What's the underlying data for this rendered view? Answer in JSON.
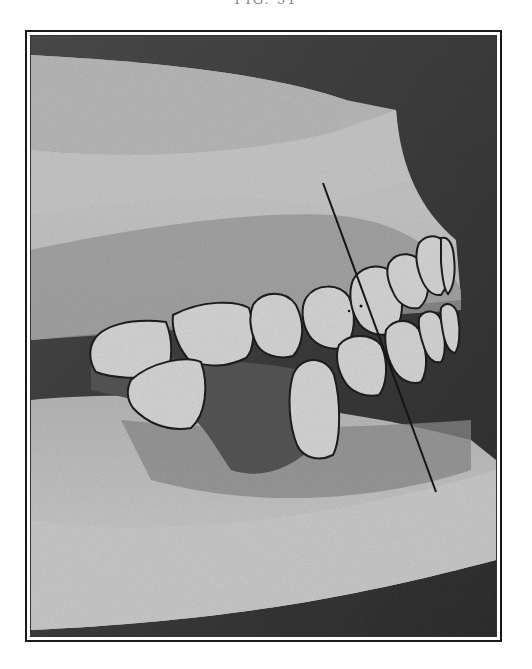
{
  "caption": "FIG. 51",
  "photo": {
    "subject": "Plaster dental cast, lateral view, with vertical reference line",
    "colors": {
      "background_dark": "#3a3a3a",
      "plaster_light": "#c9c9c9",
      "plaster_mid": "#a9a9a9",
      "gum_shadow": "#6e6e6e",
      "tooth_fill": "#d6d6d6",
      "outline": "#1c1c1c"
    },
    "reference_line": {
      "x1": 322,
      "y1": 183,
      "x2": 435,
      "y2": 492
    }
  }
}
